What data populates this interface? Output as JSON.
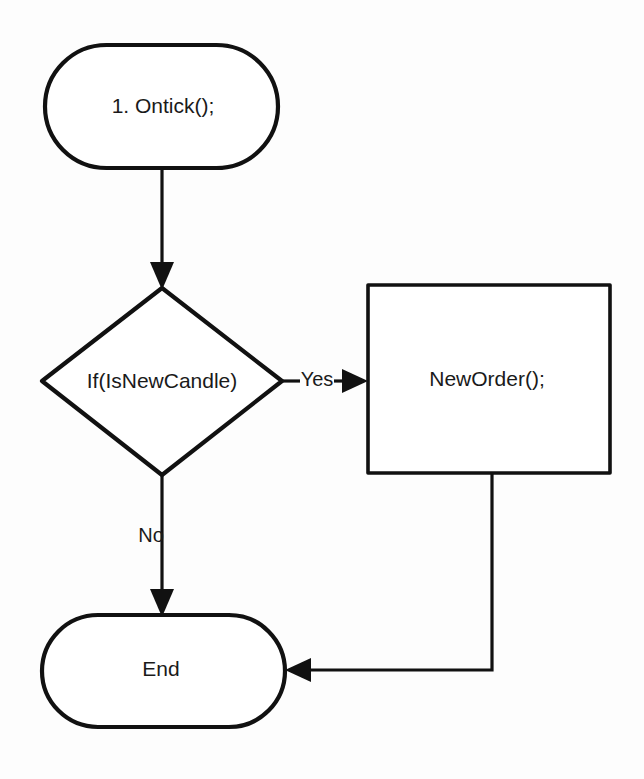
{
  "diagram": {
    "background_color": "#fdfdfd",
    "stroke_color": "#111111",
    "text_color": "#1a1a1a",
    "nodes": [
      {
        "id": "start",
        "shape": "stadium",
        "label": "1. Ontick();"
      },
      {
        "id": "decision",
        "shape": "diamond",
        "label": "If(IsNewCandle)"
      },
      {
        "id": "action",
        "shape": "rectangle",
        "label": "NewOrder();"
      },
      {
        "id": "end",
        "shape": "stadium",
        "label": "End"
      }
    ],
    "edges": [
      {
        "id": "start-to-decision",
        "from": "start",
        "to": "decision",
        "label": ""
      },
      {
        "id": "decision-to-action",
        "from": "decision",
        "to": "action",
        "label": "Yes"
      },
      {
        "id": "decision-to-end",
        "from": "decision",
        "to": "end",
        "label": "No"
      },
      {
        "id": "action-to-end",
        "from": "action",
        "to": "end",
        "label": ""
      }
    ]
  }
}
